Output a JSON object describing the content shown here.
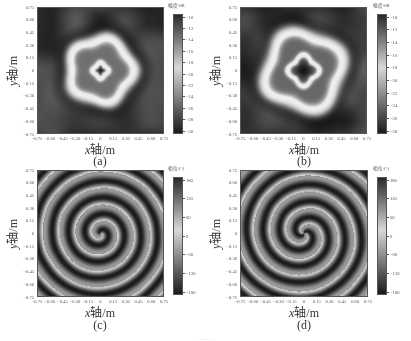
{
  "figure": {
    "caption_visible": "……"
  },
  "chart_data": [
    {
      "id": "a",
      "type": "heatmap",
      "panel_label": "(a)",
      "quantity": "amplitude",
      "pattern": "single ring with central null (l=1)",
      "xlabel": "x轴/m",
      "ylabel": "y轴/m",
      "xlim": [
        -0.75,
        0.75
      ],
      "ylim": [
        -0.75,
        0.75
      ],
      "xticks": [
        "−0.75",
        "−0.60",
        "−0.45",
        "−0.30",
        "−0.15",
        "0",
        "0.15",
        "0.30",
        "0.45",
        "0.60",
        "0.75"
      ],
      "yticks": [
        "0.75",
        "0.60",
        "0.45",
        "0.30",
        "0.15",
        "0",
        "−0.15",
        "−0.30",
        "−0.45",
        "−0.60",
        "−0.75"
      ],
      "colorbar": {
        "label": "幅度/dB",
        "ticks": [
          "−10",
          "−12",
          "−14",
          "−16",
          "−18",
          "−20",
          "−22",
          "−24",
          "−26",
          "−28",
          "−30"
        ],
        "range": [
          -30,
          -10
        ]
      },
      "colormap": "gray",
      "render": {
        "mode": "amp",
        "ringRadius": 0.52,
        "ringWidth": 0.09,
        "nullRadius": 0.06,
        "nullRing": 0.11,
        "lobes": 5,
        "lobeAmp": 0.07,
        "innerLevel": 0.42
      }
    },
    {
      "id": "b",
      "type": "heatmap",
      "panel_label": "(b)",
      "quantity": "amplitude",
      "pattern": "single ring with larger central null (l=2)",
      "xlabel": "x轴/m",
      "ylabel": "y轴/m",
      "xlim": [
        -0.75,
        0.75
      ],
      "ylim": [
        -0.75,
        0.75
      ],
      "xticks": [
        "−0.75",
        "−0.60",
        "−0.45",
        "−0.30",
        "−0.15",
        "0",
        "0.15",
        "0.30",
        "0.45",
        "0.60",
        "0.75"
      ],
      "yticks": [
        "0.75",
        "0.60",
        "0.45",
        "0.30",
        "0.15",
        "0",
        "−0.15",
        "−0.30",
        "−0.45",
        "−0.60",
        "−0.75"
      ],
      "colorbar": {
        "label": "幅度/dB",
        "ticks": [
          "−10",
          "−12",
          "−14",
          "−16",
          "−18",
          "−20",
          "−22",
          "−24",
          "−26",
          "−28"
        ],
        "range": [
          -29,
          -10
        ]
      },
      "colormap": "gray",
      "render": {
        "mode": "amp",
        "ringRadius": 0.62,
        "ringWidth": 0.1,
        "nullRadius": 0.14,
        "nullRing": 0.22,
        "lobes": 4,
        "lobeAmp": 0.1,
        "innerLevel": 0.38
      }
    },
    {
      "id": "c",
      "type": "heatmap",
      "panel_label": "(c)",
      "quantity": "phase",
      "pattern": "single-arm spiral phase (l=1)",
      "xlabel": "x轴/m",
      "ylabel": "y轴/m",
      "xlim": [
        -0.75,
        0.75
      ],
      "ylim": [
        -0.75,
        0.75
      ],
      "xticks": [
        "−0.75",
        "−0.60",
        "−0.45",
        "−0.30",
        "−0.15",
        "0",
        "0.15",
        "0.30",
        "0.45",
        "0.60",
        "0.75"
      ],
      "yticks": [
        "0.75",
        "0.60",
        "0.45",
        "0.30",
        "0.15",
        "0",
        "−0.15",
        "−0.30",
        "−0.45",
        "−0.60",
        "−0.75"
      ],
      "colorbar": {
        "label": "相位/(°)",
        "ticks": [
          "180",
          "120",
          "60",
          "0",
          "−60",
          "−120",
          "−180"
        ],
        "range": [
          -180,
          180
        ]
      },
      "colormap": "gray",
      "render": {
        "mode": "phase",
        "arms": 1,
        "radialWaves": 7.5
      }
    },
    {
      "id": "d",
      "type": "heatmap",
      "panel_label": "(d)",
      "quantity": "phase",
      "pattern": "two-arm spiral phase (l=2)",
      "xlabel": "x轴/m",
      "ylabel": "y轴/m",
      "xlim": [
        -0.75,
        0.75
      ],
      "ylim": [
        -0.75,
        0.75
      ],
      "xticks": [
        "−0.75",
        "−0.60",
        "−0.45",
        "−0.30",
        "−0.15",
        "0",
        "0.15",
        "0.30",
        "0.45",
        "0.60",
        "0.75"
      ],
      "yticks": [
        "0.75",
        "0.60",
        "0.45",
        "0.30",
        "0.15",
        "0",
        "−0.15",
        "−0.30",
        "−0.45",
        "−0.60",
        "−0.75"
      ],
      "colorbar": {
        "label": "相位/(°)",
        "ticks": [
          "180",
          "120",
          "60",
          "0",
          "−60",
          "−120",
          "−180"
        ],
        "range": [
          -180,
          180
        ]
      },
      "colormap": "gray",
      "render": {
        "mode": "phase",
        "arms": 2,
        "radialWaves": 7.5
      }
    }
  ],
  "layout": {
    "panels": [
      {
        "plot": [
          37,
          7,
          127,
          127
        ],
        "cbar": [
          173,
          14,
          10,
          120
        ],
        "cbLabel": [
          168,
          2
        ],
        "xlabel": [
          70,
          140
        ],
        "sub": [
          85,
          154
        ],
        "ylabel": [
          -8,
          62
        ]
      },
      {
        "plot": [
          240,
          7,
          127,
          127
        ],
        "cbar": [
          377,
          14,
          10,
          120
        ],
        "cbLabel": [
          373,
          2
        ],
        "xlabel": [
          274,
          140
        ],
        "sub": [
          289,
          154
        ],
        "ylabel": [
          195,
          62
        ]
      },
      {
        "plot": [
          37,
          170,
          127,
          127
        ],
        "cbar": [
          173,
          177,
          10,
          118
        ],
        "cbLabel": [
          168,
          165
        ],
        "xlabel": [
          70,
          303
        ],
        "sub": [
          85,
          318
        ],
        "ylabel": [
          -8,
          225
        ]
      },
      {
        "plot": [
          240,
          170,
          128,
          127
        ],
        "cbar": [
          377,
          177,
          10,
          118
        ],
        "cbLabel": [
          373,
          165
        ],
        "xlabel": [
          274,
          303
        ],
        "sub": [
          289,
          318
        ],
        "ylabel": [
          195,
          225
        ]
      }
    ]
  }
}
